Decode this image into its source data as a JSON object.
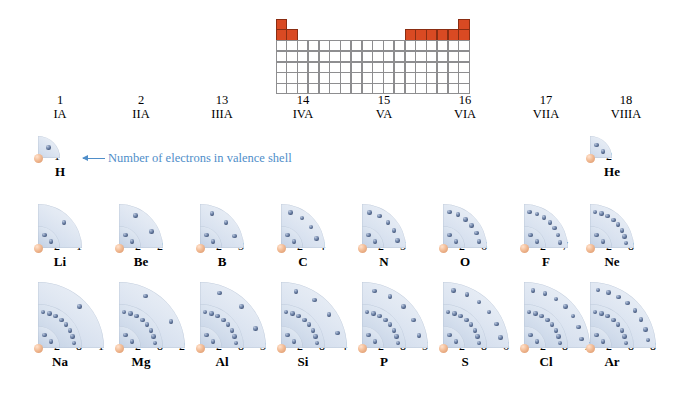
{
  "figure": {
    "annotation": "Number of electrons in valence shell",
    "nucleus_color": "#e3a277",
    "electron_color": "#3d4f73",
    "shell_color": "#d5dfee",
    "highlight_color": "#d94a23",
    "annotation_color": "#4f8ec9"
  },
  "mini_periodic_table": {
    "name": "mini-periodic-table",
    "columns": 18,
    "rows": 7,
    "highlighted_groups": [
      1,
      2,
      13,
      14,
      15,
      16,
      17,
      18
    ],
    "highlighted_rows": [
      1,
      2
    ]
  },
  "groups": [
    {
      "number": "1",
      "roman": "IA"
    },
    {
      "number": "2",
      "roman": "IIA"
    },
    {
      "number": "13",
      "roman": "IIIA"
    },
    {
      "number": "14",
      "roman": "IVA"
    },
    {
      "number": "15",
      "roman": "VA"
    },
    {
      "number": "16",
      "roman": "VIA"
    },
    {
      "number": "17",
      "roman": "VIIA"
    },
    {
      "number": "18",
      "roman": "VIIIA"
    }
  ],
  "chart_data": {
    "type": "diagram",
    "period_labels": [
      "1",
      "2",
      "3"
    ],
    "elements": [
      {
        "symbol": "H",
        "group": 1,
        "period": 1,
        "shells": [
          1
        ]
      },
      {
        "symbol": "He",
        "group": 18,
        "period": 1,
        "shells": [
          2
        ]
      },
      {
        "symbol": "Li",
        "group": 1,
        "period": 2,
        "shells": [
          2,
          1
        ]
      },
      {
        "symbol": "Be",
        "group": 2,
        "period": 2,
        "shells": [
          2,
          2
        ]
      },
      {
        "symbol": "B",
        "group": 13,
        "period": 2,
        "shells": [
          2,
          3
        ]
      },
      {
        "symbol": "C",
        "group": 14,
        "period": 2,
        "shells": [
          2,
          4
        ]
      },
      {
        "symbol": "N",
        "group": 15,
        "period": 2,
        "shells": [
          2,
          5
        ]
      },
      {
        "symbol": "O",
        "group": 16,
        "period": 2,
        "shells": [
          2,
          6
        ]
      },
      {
        "symbol": "F",
        "group": 17,
        "period": 2,
        "shells": [
          2,
          7
        ]
      },
      {
        "symbol": "Ne",
        "group": 18,
        "period": 2,
        "shells": [
          2,
          8
        ]
      },
      {
        "symbol": "Na",
        "group": 1,
        "period": 3,
        "shells": [
          2,
          8,
          1
        ]
      },
      {
        "symbol": "Mg",
        "group": 2,
        "period": 3,
        "shells": [
          2,
          8,
          2
        ]
      },
      {
        "symbol": "Al",
        "group": 13,
        "period": 3,
        "shells": [
          2,
          8,
          3
        ]
      },
      {
        "symbol": "Si",
        "group": 14,
        "period": 3,
        "shells": [
          2,
          8,
          4
        ]
      },
      {
        "symbol": "P",
        "group": 15,
        "period": 3,
        "shells": [
          2,
          8,
          5
        ]
      },
      {
        "symbol": "S",
        "group": 16,
        "period": 3,
        "shells": [
          2,
          8,
          6
        ]
      },
      {
        "symbol": "Cl",
        "group": 17,
        "period": 3,
        "shells": [
          2,
          8,
          7
        ]
      },
      {
        "symbol": "Ar",
        "group": 18,
        "period": 3,
        "shells": [
          2,
          8,
          8
        ]
      }
    ]
  }
}
